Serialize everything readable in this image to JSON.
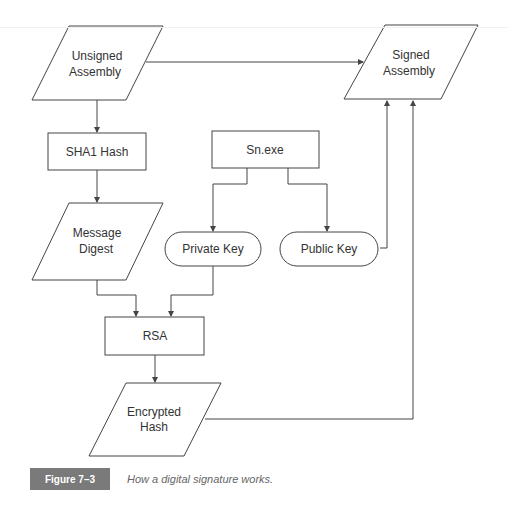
{
  "diagram": {
    "nodes": {
      "unsigned_assembly": {
        "line1": "Unsigned",
        "line2": "Assembly",
        "shape": "parallelogram"
      },
      "signed_assembly": {
        "line1": "Signed",
        "line2": "Assembly",
        "shape": "parallelogram"
      },
      "sha1_hash": {
        "label": "SHA1 Hash",
        "shape": "rectangle"
      },
      "sn_exe": {
        "label": "Sn.exe",
        "shape": "rectangle"
      },
      "message_digest": {
        "line1": "Message",
        "line2": "Digest",
        "shape": "parallelogram"
      },
      "private_key": {
        "label": "Private Key",
        "shape": "rounded"
      },
      "public_key": {
        "label": "Public Key",
        "shape": "rounded"
      },
      "rsa": {
        "label": "RSA",
        "shape": "rectangle"
      },
      "encrypted_hash": {
        "line1": "Encrypted",
        "line2": "Hash",
        "shape": "parallelogram"
      }
    },
    "edges": [
      {
        "from": "Unsigned Assembly",
        "to": "Signed Assembly"
      },
      {
        "from": "Unsigned Assembly",
        "to": "SHA1 Hash"
      },
      {
        "from": "SHA1 Hash",
        "to": "Message Digest"
      },
      {
        "from": "Sn.exe",
        "to": "Private Key"
      },
      {
        "from": "Sn.exe",
        "to": "Public Key"
      },
      {
        "from": "Public Key",
        "to": "Signed Assembly"
      },
      {
        "from": "Message Digest",
        "to": "RSA"
      },
      {
        "from": "Private Key",
        "to": "RSA"
      },
      {
        "from": "RSA",
        "to": "Encrypted Hash"
      },
      {
        "from": "Encrypted Hash",
        "to": "Signed Assembly"
      }
    ]
  },
  "caption": {
    "label": "Figure 7–3",
    "text": "How a digital signature works."
  }
}
